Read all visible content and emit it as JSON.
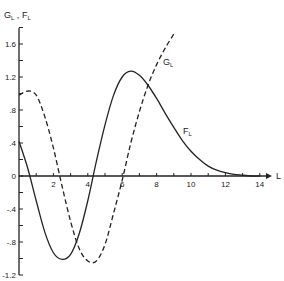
{
  "chart_data": {
    "type": "line",
    "title": "",
    "xlabel": "L",
    "ylabel": "G_L , F_L",
    "xlim": [
      0,
      15
    ],
    "ylim": [
      -1.2,
      1.8
    ],
    "grid": false,
    "legend": "inline labels on curves",
    "x_ticks": [
      2,
      4,
      6,
      8,
      10,
      12,
      14
    ],
    "x_tick_labels": [
      "2",
      "4",
      "6",
      "8",
      "10",
      "12",
      "14"
    ],
    "y_ticks": [
      -1.2,
      -0.8,
      -0.4,
      0,
      0.4,
      0.8,
      1.2,
      1.6
    ],
    "y_tick_labels": [
      "-1.2",
      "-.8",
      "-.4",
      "0",
      ".4",
      ".8",
      "1.2",
      "1.6"
    ],
    "series": [
      {
        "name": "F_L",
        "style": "solid",
        "x": [
          0,
          0.5,
          1,
          1.5,
          2,
          2.5,
          3,
          3.5,
          4,
          4.5,
          5,
          5.5,
          6,
          6.5,
          7,
          7.5,
          8,
          8.5,
          9,
          9.5,
          10,
          10.5,
          11,
          11.5,
          12,
          12.5,
          13,
          13.5,
          14
        ],
        "values": [
          0.42,
          0.1,
          -0.3,
          -0.68,
          -0.93,
          -1.01,
          -0.95,
          -0.7,
          -0.3,
          0.18,
          0.62,
          0.98,
          1.2,
          1.27,
          1.22,
          1.1,
          0.94,
          0.76,
          0.59,
          0.43,
          0.3,
          0.2,
          0.12,
          0.07,
          0.04,
          0.02,
          0.01,
          0.0,
          0.0
        ]
      },
      {
        "name": "G_L",
        "style": "dashed",
        "x": [
          0,
          0.5,
          1,
          1.5,
          2,
          2.5,
          3,
          3.5,
          4,
          4.5,
          5,
          5.5,
          6,
          6.5,
          7,
          7.5,
          8,
          8.5,
          9
        ],
        "values": [
          0.98,
          1.03,
          0.98,
          0.72,
          0.34,
          -0.12,
          -0.55,
          -0.88,
          -1.03,
          -1.03,
          -0.83,
          -0.45,
          -0.05,
          0.4,
          0.78,
          1.1,
          1.35,
          1.55,
          1.72
        ]
      }
    ],
    "annotations": [
      {
        "text": "G_L",
        "x": 8.6,
        "y": 1.15
      },
      {
        "text": "F_L",
        "x": 9.4,
        "y": 0.55
      }
    ]
  },
  "labels": {
    "y_axis_main": "G",
    "y_axis_sub1": "L",
    "y_axis_sep": " , ",
    "y_axis_main2": "F",
    "y_axis_sub2": "L",
    "x_axis": "L",
    "g_curve": "G",
    "g_curve_sub": "L",
    "f_curve": "F",
    "f_curve_sub": "L"
  }
}
